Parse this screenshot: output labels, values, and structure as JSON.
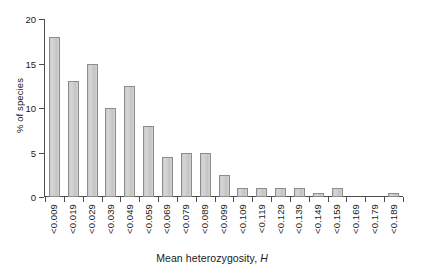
{
  "chart_data": {
    "type": "bar",
    "title": "",
    "xlabel": "Mean heterozygosity, H",
    "xlabel_text": "Mean heterozygosity,",
    "xlabel_symbol": "H",
    "ylabel": "% of species",
    "ylim": [
      0,
      20
    ],
    "yticks": [
      0,
      5,
      10,
      15,
      20
    ],
    "ytick_labels": [
      "0",
      "5",
      "10",
      "15",
      "20"
    ],
    "grid": false,
    "legend": false,
    "categories": [
      "<0.009",
      "<0.019",
      "<0.029",
      "<0.039",
      "<0.049",
      "<0.059",
      "<0.069",
      "<0.079",
      "<0.089",
      "<0.099",
      "<0.109",
      "<0.119",
      "<0.129",
      "<0.139",
      "<0.149",
      "<0.159",
      "<0.169",
      "<0.179",
      "<0.189"
    ],
    "values": [
      18.0,
      13.0,
      15.0,
      10.0,
      12.5,
      8.0,
      4.5,
      5.0,
      5.0,
      2.5,
      1.0,
      1.0,
      1.0,
      1.0,
      0.4,
      1.0,
      0.0,
      0.0,
      0.4
    ],
    "bar_fill_color": "#cfcfcf",
    "bar_edge_color": "#8c8c8c",
    "axis_color": "#4d4d4d"
  }
}
